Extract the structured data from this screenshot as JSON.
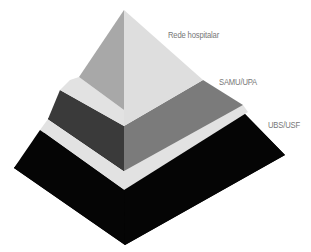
{
  "diagram": {
    "type": "pyramid",
    "tiers": [
      {
        "id": "top",
        "label": "Rede hospitalar",
        "left_color": "#a8a8a8",
        "right_color": "#dedede"
      },
      {
        "id": "middle",
        "label": "SAMU/UPA",
        "left_color": "#3a3a3a",
        "right_color": "#7b7b7b"
      },
      {
        "id": "base",
        "label": "UBS/USF",
        "left_color": "#050505",
        "right_color": "#050505"
      }
    ],
    "separator_color": "#e2e2e2"
  }
}
